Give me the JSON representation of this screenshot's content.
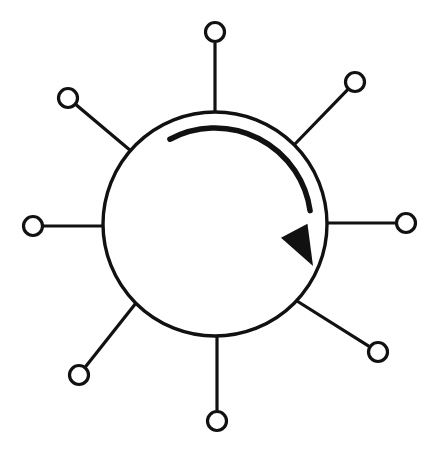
{
  "figure": {
    "type": "line-diagram",
    "background_color": "#ffffff",
    "stroke_color": "#111111",
    "canvas": {
      "width": 437,
      "height": 461
    }
  },
  "hub": {
    "label": "central-circle",
    "center_x": 215,
    "center_y": 224,
    "radius": 112,
    "stroke_width": 3.4,
    "fill": "none"
  },
  "rotation_arrow": {
    "label": "clockwise-rotation-arrow",
    "direction": "clockwise",
    "arc_radius": 96,
    "start_angle_deg": 118,
    "end_angle_deg": 8,
    "stroke_width": 5.5,
    "head_length": 40,
    "head_width": 30,
    "head_tip_x": 313,
    "head_tip_y": 266,
    "head_angle_deg": 62
  },
  "spokes": [
    {
      "id": "spoke-top",
      "label": "top",
      "angle_deg": 90,
      "node_x": 215,
      "node_y": 32,
      "node_radius": 9.5,
      "hub_x": 215,
      "hub_y": 112
    },
    {
      "id": "spoke-upper-right",
      "label": "upper-right",
      "angle_deg": 45,
      "node_x": 355,
      "node_y": 82,
      "node_radius": 9.5,
      "hub_x": 294,
      "hub_y": 145
    },
    {
      "id": "spoke-right",
      "label": "right",
      "angle_deg": 0,
      "node_x": 406,
      "node_y": 223,
      "node_radius": 9.5,
      "hub_x": 327,
      "hub_y": 223
    },
    {
      "id": "spoke-lower-right",
      "label": "lower-right",
      "angle_deg": -45,
      "node_x": 378,
      "node_y": 352,
      "node_radius": 9.5,
      "hub_x": 297,
      "hub_y": 301
    },
    {
      "id": "spoke-bottom",
      "label": "bottom",
      "angle_deg": -90,
      "node_x": 217,
      "node_y": 421,
      "node_radius": 9.5,
      "hub_x": 217,
      "hub_y": 336
    },
    {
      "id": "spoke-lower-left",
      "label": "lower-left",
      "angle_deg": -135,
      "node_x": 79,
      "node_y": 375,
      "node_radius": 9.5,
      "hub_x": 136,
      "hub_y": 303
    },
    {
      "id": "spoke-left",
      "label": "left",
      "angle_deg": 180,
      "node_x": 33,
      "node_y": 226,
      "node_radius": 9.5,
      "hub_x": 104,
      "hub_y": 226
    },
    {
      "id": "spoke-upper-left",
      "label": "upper-left",
      "angle_deg": 135,
      "node_x": 68,
      "node_y": 98,
      "node_radius": 9.5,
      "hub_x": 131,
      "hub_y": 151
    }
  ]
}
